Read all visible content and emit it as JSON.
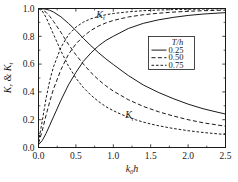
{
  "chart_data": {
    "type": "line",
    "title": "",
    "xlabel": "k0h",
    "xlabel_parts": {
      "main": "k",
      "sub": "0",
      "tail": "h"
    },
    "ylabel": "Kr & Kt",
    "ylabel_parts": {
      "first": "K",
      "first_sub": "r",
      "amp": " & ",
      "second": "K",
      "second_sub": "t"
    },
    "xlim": [
      0.0,
      2.5
    ],
    "ylim": [
      0.0,
      1.0
    ],
    "xticks": [
      "0.0",
      "0.5",
      "1.0",
      "1.5",
      "2.0",
      "2.5"
    ],
    "xtick_values": [
      0.0,
      0.5,
      1.0,
      1.5,
      2.0,
      2.5
    ],
    "yticks": [
      "0.0",
      "0.2",
      "0.4",
      "0.6",
      "0.8",
      "1.0"
    ],
    "ytick_values": [
      0.0,
      0.2,
      0.4,
      0.6,
      0.8,
      1.0
    ],
    "minor_ticks": true,
    "grid": false,
    "legend": {
      "title": "T/h",
      "title_parts": {
        "num": "T",
        "slash": "/",
        "den": "h"
      },
      "position": "upper-right-inside",
      "entries": [
        {
          "label": "0.25",
          "style": "solid"
        },
        {
          "label": "0.50",
          "style": "dashed"
        },
        {
          "label": "0.75",
          "style": "fine-dashed"
        }
      ]
    },
    "annotations": [
      {
        "text": "Kt",
        "base": "K",
        "sub": "t",
        "x": 0.83,
        "y": 0.93
      },
      {
        "text": "Kr",
        "base": "K",
        "sub": "r",
        "x": 1.22,
        "y": 0.21
      }
    ],
    "series": [
      {
        "name": "Kt, T/h = 0.25",
        "coefficient": "Kt",
        "T_over_h": 0.25,
        "style": "solid",
        "x": [
          0.0,
          0.05,
          0.1,
          0.15,
          0.2,
          0.3,
          0.4,
          0.5,
          0.6,
          0.7,
          0.8,
          0.9,
          1.0,
          1.2,
          1.4,
          1.6,
          1.8,
          2.0,
          2.2,
          2.4,
          2.5
        ],
        "y": [
          0.02,
          0.05,
          0.1,
          0.16,
          0.22,
          0.34,
          0.45,
          0.54,
          0.62,
          0.68,
          0.73,
          0.77,
          0.8,
          0.856,
          0.893,
          0.918,
          0.936,
          0.95,
          0.96,
          0.967,
          0.97
        ]
      },
      {
        "name": "Kt, T/h = 0.50",
        "coefficient": "Kt",
        "T_over_h": 0.5,
        "style": "dashed",
        "x": [
          0.0,
          0.05,
          0.1,
          0.15,
          0.2,
          0.3,
          0.4,
          0.5,
          0.6,
          0.7,
          0.8,
          0.9,
          1.0,
          1.2,
          1.4,
          1.6,
          1.8,
          2.0,
          2.2,
          2.4,
          2.5
        ],
        "y": [
          0.03,
          0.12,
          0.23,
          0.33,
          0.42,
          0.56,
          0.67,
          0.745,
          0.8,
          0.842,
          0.873,
          0.896,
          0.914,
          0.939,
          0.955,
          0.966,
          0.974,
          0.98,
          0.984,
          0.987,
          0.988
        ]
      },
      {
        "name": "Kt, T/h = 0.75",
        "coefficient": "Kt",
        "T_over_h": 0.75,
        "style": "fine-dashed",
        "x": [
          0.0,
          0.05,
          0.1,
          0.15,
          0.2,
          0.3,
          0.4,
          0.5,
          0.6,
          0.7,
          0.8,
          0.9,
          1.0,
          1.2,
          1.4,
          1.6,
          1.8,
          2.0,
          2.2,
          2.4,
          2.5
        ],
        "y": [
          0.04,
          0.19,
          0.35,
          0.48,
          0.58,
          0.72,
          0.81,
          0.866,
          0.902,
          0.926,
          0.943,
          0.955,
          0.964,
          0.976,
          0.984,
          0.989,
          0.992,
          0.994,
          0.996,
          0.997,
          0.997
        ]
      },
      {
        "name": "Kr, T/h = 0.25",
        "coefficient": "Kr",
        "T_over_h": 0.25,
        "style": "solid",
        "x": [
          0.0,
          0.05,
          0.1,
          0.15,
          0.2,
          0.3,
          0.4,
          0.5,
          0.6,
          0.7,
          0.8,
          0.9,
          1.0,
          1.2,
          1.4,
          1.6,
          1.8,
          2.0,
          2.2,
          2.4,
          2.5
        ],
        "y": [
          1.0,
          0.999,
          0.995,
          0.987,
          0.975,
          0.94,
          0.893,
          0.842,
          0.785,
          0.733,
          0.683,
          0.638,
          0.597,
          0.518,
          0.45,
          0.397,
          0.352,
          0.312,
          0.279,
          0.253,
          0.241
        ]
      },
      {
        "name": "Kr, T/h = 0.50",
        "coefficient": "Kr",
        "T_over_h": 0.5,
        "style": "dashed",
        "x": [
          0.0,
          0.05,
          0.1,
          0.15,
          0.2,
          0.3,
          0.4,
          0.5,
          0.6,
          0.7,
          0.8,
          0.9,
          1.0,
          1.2,
          1.4,
          1.6,
          1.8,
          2.0,
          2.2,
          2.4,
          2.5
        ],
        "y": [
          1.0,
          0.993,
          0.973,
          0.944,
          0.908,
          0.828,
          0.742,
          0.667,
          0.6,
          0.54,
          0.488,
          0.444,
          0.406,
          0.344,
          0.296,
          0.258,
          0.227,
          0.2,
          0.178,
          0.161,
          0.153
        ]
      },
      {
        "name": "Kr, T/h = 0.75",
        "coefficient": "Kr",
        "T_over_h": 0.75,
        "style": "fine-dashed",
        "x": [
          0.0,
          0.05,
          0.1,
          0.15,
          0.2,
          0.3,
          0.4,
          0.5,
          0.6,
          0.7,
          0.8,
          0.9,
          1.0,
          1.1,
          1.2,
          1.3,
          1.4,
          1.5,
          1.6,
          1.8,
          2.0,
          2.2,
          2.4,
          2.5
        ],
        "y": [
          1.0,
          0.982,
          0.937,
          0.877,
          0.815,
          0.694,
          0.587,
          0.499,
          0.431,
          0.377,
          0.332,
          0.294,
          0.265,
          0.24,
          0.218,
          0.199,
          0.183,
          0.169,
          0.157,
          0.137,
          0.121,
          0.108,
          0.098,
          0.094
        ]
      }
    ]
  }
}
